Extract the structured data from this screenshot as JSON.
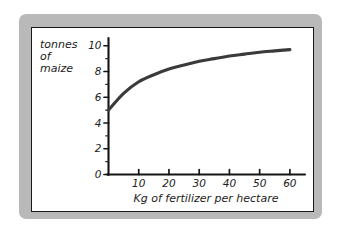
{
  "figure": {
    "style": "hand-drawn pencil sketch on white paper with gray scanned border",
    "frame_color": "#b3b3b3",
    "paper_color": "#ffffff",
    "ink_color": "#1c1c1c",
    "curve_color": "#3a3a3a"
  },
  "chart_data": {
    "type": "line",
    "title": "",
    "xlabel": "Kg of fertilizer per hectare",
    "ylabel": "tonnes of maize",
    "ylabel_lines": [
      "tonnes",
      "of",
      "maize"
    ],
    "x": [
      0,
      5,
      10,
      15,
      20,
      25,
      30,
      35,
      40,
      45,
      50,
      55,
      60
    ],
    "values": [
      5.0,
      6.3,
      7.2,
      7.75,
      8.2,
      8.5,
      8.8,
      9.0,
      9.2,
      9.35,
      9.5,
      9.6,
      9.7
    ],
    "series": [
      {
        "name": "tonnes of maize",
        "values": [
          5.0,
          6.3,
          7.2,
          7.75,
          8.2,
          8.5,
          8.8,
          9.0,
          9.2,
          9.35,
          9.5,
          9.6,
          9.7
        ]
      }
    ],
    "xlim": [
      0,
      65
    ],
    "ylim": [
      0,
      10.6
    ],
    "xticks": [
      10,
      20,
      30,
      40,
      50,
      60
    ],
    "xtick_labels": [
      "10",
      "20",
      "30",
      "40",
      "50",
      "60"
    ],
    "yticks": [
      0,
      2,
      4,
      6,
      8,
      10
    ],
    "ytick_labels": [
      "0",
      "2",
      "4",
      "6",
      "8",
      "10"
    ],
    "y_minor_ticks": [
      1,
      3,
      5,
      7,
      9
    ],
    "x_minor_ticks": [
      5,
      15,
      25,
      35,
      45,
      55
    ],
    "grid": false,
    "legend": false,
    "legend_position": "none",
    "annotations": []
  },
  "axes": {
    "y_axis_name": "y-axis",
    "x_axis_name": "x-axis",
    "origin_label": "0"
  }
}
